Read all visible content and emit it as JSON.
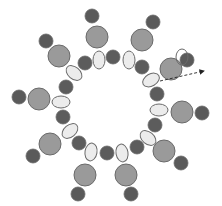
{
  "diagram": {
    "type": "ring-structure",
    "width": 222,
    "height": 206,
    "colors": {
      "outer_dark": "#5a5a5a",
      "large_grey": "#9a9a9a",
      "inner_dark": "#5c5c5c",
      "ellipse_fill": "#ececec",
      "stroke": "#6a6a6a",
      "arrow": "#222222"
    },
    "outer_dark_circles": [
      {
        "cx": 92,
        "cy": 16,
        "r": 7
      },
      {
        "cx": 153,
        "cy": 22,
        "r": 7
      },
      {
        "cx": 46,
        "cy": 41,
        "r": 7
      },
      {
        "cx": 187,
        "cy": 60,
        "r": 7
      },
      {
        "cx": 19,
        "cy": 97,
        "r": 7
      },
      {
        "cx": 202,
        "cy": 113,
        "r": 7
      },
      {
        "cx": 33,
        "cy": 156,
        "r": 7
      },
      {
        "cx": 181,
        "cy": 163,
        "r": 7
      },
      {
        "cx": 78,
        "cy": 194,
        "r": 7
      },
      {
        "cx": 131,
        "cy": 194,
        "r": 7
      }
    ],
    "large_grey_circles": [
      {
        "cx": 97,
        "cy": 37,
        "r": 11
      },
      {
        "cx": 142,
        "cy": 40,
        "r": 11
      },
      {
        "cx": 59,
        "cy": 56,
        "r": 11
      },
      {
        "cx": 171,
        "cy": 69,
        "r": 11
      },
      {
        "cx": 39,
        "cy": 99,
        "r": 11
      },
      {
        "cx": 182,
        "cy": 112,
        "r": 11
      },
      {
        "cx": 50,
        "cy": 144,
        "r": 11
      },
      {
        "cx": 164,
        "cy": 151,
        "r": 11
      },
      {
        "cx": 85,
        "cy": 175,
        "r": 11
      },
      {
        "cx": 126,
        "cy": 175,
        "r": 11
      }
    ],
    "inner_dark_circles": [
      {
        "cx": 113,
        "cy": 57,
        "r": 7
      },
      {
        "cx": 85,
        "cy": 63,
        "r": 7
      },
      {
        "cx": 142,
        "cy": 67,
        "r": 7
      },
      {
        "cx": 66,
        "cy": 87,
        "r": 7
      },
      {
        "cx": 157,
        "cy": 94,
        "r": 7
      },
      {
        "cx": 63,
        "cy": 117,
        "r": 7
      },
      {
        "cx": 155,
        "cy": 125,
        "r": 7
      },
      {
        "cx": 79,
        "cy": 143,
        "r": 7
      },
      {
        "cx": 107,
        "cy": 153,
        "r": 7
      },
      {
        "cx": 137,
        "cy": 147,
        "r": 7
      }
    ],
    "ellipses": [
      {
        "cx": 99,
        "cy": 60,
        "rx": 6,
        "ry": 9,
        "rot": 0
      },
      {
        "cx": 129,
        "cy": 60,
        "rx": 6,
        "ry": 9,
        "rot": 0
      },
      {
        "cx": 74,
        "cy": 73,
        "rx": 6,
        "ry": 9,
        "rot": -50
      },
      {
        "cx": 151,
        "cy": 80,
        "rx": 6,
        "ry": 9,
        "rot": 60
      },
      {
        "cx": 61,
        "cy": 102,
        "rx": 9,
        "ry": 6,
        "rot": 0
      },
      {
        "cx": 159,
        "cy": 110,
        "rx": 9,
        "ry": 6,
        "rot": 0
      },
      {
        "cx": 70,
        "cy": 131,
        "rx": 6,
        "ry": 9,
        "rot": 50
      },
      {
        "cx": 148,
        "cy": 138,
        "rx": 6,
        "ry": 9,
        "rot": -50
      },
      {
        "cx": 91,
        "cy": 152,
        "rx": 6,
        "ry": 9,
        "rot": 10
      },
      {
        "cx": 122,
        "cy": 153,
        "rx": 6,
        "ry": 9,
        "rot": -10
      }
    ],
    "highlight_outline": {
      "cx": 182,
      "cy": 57,
      "rx": 6,
      "ry": 8
    },
    "arrow": {
      "x1": 160,
      "y1": 81,
      "x2": 204,
      "y2": 71
    }
  }
}
